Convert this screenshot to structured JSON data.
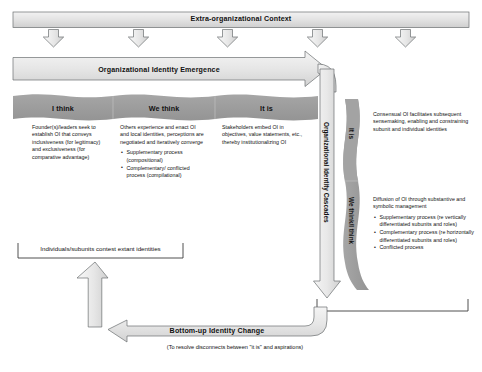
{
  "diagram": {
    "colors": {
      "ribbon_gray": "#9d9d9d",
      "arrow_fill_light": "#e8e8e8",
      "arrow_fill_mid": "#dcdcdc",
      "outline": "#55595b",
      "text": "#111111"
    },
    "top_banner": {
      "label": "Extra-organizational Context",
      "down_arrow_count": 5
    },
    "emergence_arrow": {
      "label": "Organizational Identity Emergence"
    },
    "cascades_arrow": {
      "label": "Organizational Identity Cascades"
    },
    "stage_ribbon": {
      "segments": [
        {
          "label": "I think"
        },
        {
          "label": "We think"
        },
        {
          "label": "It is"
        }
      ]
    },
    "vertical_ribbon": {
      "segments": [
        {
          "label": "It is"
        },
        {
          "label": "We think/I think"
        }
      ]
    },
    "columns": [
      {
        "name": "i-think",
        "paragraph": "Founder(s)/leaders seek to establish OI that conveys inclusiveness (for legitimacy) and exclusiveness (for comparative advantage)",
        "bullets": []
      },
      {
        "name": "we-think",
        "paragraph": "Others experience and enact OI and local identities, perceptions are negotiated and iteratively converge",
        "bullets": [
          "Supplementary process (compositional)",
          "Complementary/ conflicted process (compilational)"
        ]
      },
      {
        "name": "it-is",
        "paragraph": "Stakeholders embed OI in objectives, value statements, etc., thereby institutionalizing OI",
        "bullets": []
      }
    ],
    "right_panels": [
      {
        "name": "consensual-oi",
        "paragraph": "Consensual OI facilitates subsequent sensemaking, enabling and constraining subunit and individual identities",
        "bullets": []
      },
      {
        "name": "diffusion-of-oi",
        "paragraph": "Diffusion of OI through substantive and symbolic management",
        "bullets": [
          "Supplementary process (re vertically differentiated subunits and roles)",
          "Complementary process (re horizontally differentiated subunits and roles)",
          "Conflicted process"
        ]
      }
    ],
    "bottom": {
      "contest_label": "Individuals/subunits contest extant identities",
      "change_arrow_label": "Bottom-up Identity Change",
      "change_arrow_sublabel": "(To resolve disconnects between \"it is\" and aspirations)"
    }
  }
}
